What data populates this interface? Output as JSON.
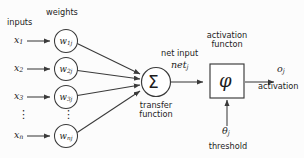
{
  "diagram": {
    "stroke_color": "#3a3a3a",
    "text_color": "#1c1c1c",
    "background": "#fcfcfc",
    "headers": {
      "inputs": "inputs",
      "weights": "weights",
      "activation_function": "activation\nfuncton",
      "activation_function_line1": "activation",
      "activation_function_line2": "functon",
      "net_input": "net input",
      "transfer_function_line1": "transfer",
      "transfer_function_line2": "function",
      "threshold": "threshold",
      "activation_out": "activation"
    },
    "inputs": [
      {
        "label": "x",
        "sub": "1"
      },
      {
        "label": "x",
        "sub": "2"
      },
      {
        "label": "x",
        "sub": "3"
      },
      {
        "label": "⋮",
        "sub": ""
      },
      {
        "label": "x",
        "sub": "n"
      }
    ],
    "weights": [
      {
        "label": "w",
        "sub": "1j"
      },
      {
        "label": "w",
        "sub": "2j"
      },
      {
        "label": "w",
        "sub": "3j"
      },
      {
        "label": "⋮",
        "sub": ""
      },
      {
        "label": "w",
        "sub": "nj"
      }
    ],
    "summation_symbol": "Σ",
    "activation_symbol": "φ",
    "net_input_symbol": {
      "label": "net",
      "sub": "j"
    },
    "threshold_symbol": {
      "label": "θ",
      "sub": "j"
    },
    "output_symbol": {
      "label": "o",
      "sub": "j"
    }
  }
}
